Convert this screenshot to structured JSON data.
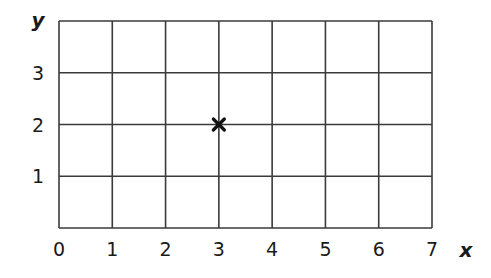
{
  "chart_data": {
    "type": "scatter",
    "title": "",
    "xlabel": "x",
    "ylabel": "y",
    "xlim": [
      0,
      7
    ],
    "ylim": [
      0,
      4
    ],
    "grid": true,
    "x_ticks": [
      "0",
      "1",
      "2",
      "3",
      "4",
      "5",
      "6",
      "7"
    ],
    "y_ticks": [
      "1",
      "2",
      "3"
    ],
    "series": [
      {
        "name": "point",
        "marker": "x",
        "points": [
          {
            "x": 3,
            "y": 2
          }
        ]
      }
    ],
    "legend": null
  },
  "colors": {
    "grid": "#3a3a3a",
    "text": "#1a1a1a",
    "marker": "#111111"
  }
}
